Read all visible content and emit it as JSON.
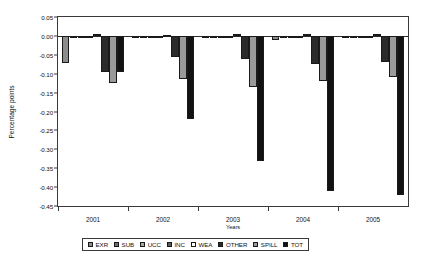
{
  "chart_data": {
    "type": "bar",
    "title": "",
    "xlabel": "Years",
    "ylabel": "Percentage points",
    "categories": [
      "2001",
      "2002",
      "2003",
      "2004",
      "2005"
    ],
    "ylim": [
      -0.45,
      0.05
    ],
    "ytick_step": 0.05,
    "yticks": [
      "0.05",
      "0.00",
      "-0.05",
      "-0.10",
      "-0.15",
      "-0.20",
      "-0.25",
      "-0.30",
      "-0.35",
      "-0.40",
      "-0.45"
    ],
    "ytick_values": [
      0.05,
      0.0,
      -0.05,
      -0.1,
      -0.15,
      -0.2,
      -0.25,
      -0.3,
      -0.35,
      -0.4,
      -0.45
    ],
    "grid": false,
    "legend_position": "bottom",
    "series": [
      {
        "name": "EXR",
        "color": "#8c8c8c",
        "values": [
          -0.073,
          -0.005,
          -0.004,
          -0.012,
          -0.004
        ]
      },
      {
        "name": "SUB",
        "color": "#6e6e6e",
        "values": [
          -0.003,
          -0.002,
          -0.002,
          -0.002,
          -0.002
        ]
      },
      {
        "name": "UCC",
        "color": "#a8a8a8",
        "values": [
          -0.002,
          -0.003,
          -0.003,
          -0.003,
          -0.003
        ]
      },
      {
        "name": "INC",
        "color": "#5a5a5a",
        "values": [
          -0.002,
          -0.002,
          -0.002,
          -0.002,
          -0.002
        ]
      },
      {
        "name": "WEA",
        "color": "#ffffff",
        "values": [
          0.004,
          0.003,
          0.004,
          0.006,
          0.006
        ]
      },
      {
        "name": "OTHER",
        "color": "#2b2b2b",
        "values": [
          -0.095,
          -0.055,
          -0.06,
          -0.075,
          -0.07
        ]
      },
      {
        "name": "SPILL",
        "color": "#9a9a9a",
        "values": [
          -0.125,
          -0.115,
          -0.135,
          -0.12,
          -0.11
        ]
      },
      {
        "name": "TOT",
        "color": "#121212",
        "values": [
          -0.095,
          -0.22,
          -0.33,
          -0.41,
          -0.42
        ]
      }
    ]
  },
  "legend": {
    "items": [
      {
        "label": "EXR"
      },
      {
        "label": "SUB"
      },
      {
        "label": "UCC"
      },
      {
        "label": "INC"
      },
      {
        "label": "WEA"
      },
      {
        "label": "OTHER"
      },
      {
        "label": "SPILL"
      },
      {
        "label": "TOT"
      }
    ]
  }
}
